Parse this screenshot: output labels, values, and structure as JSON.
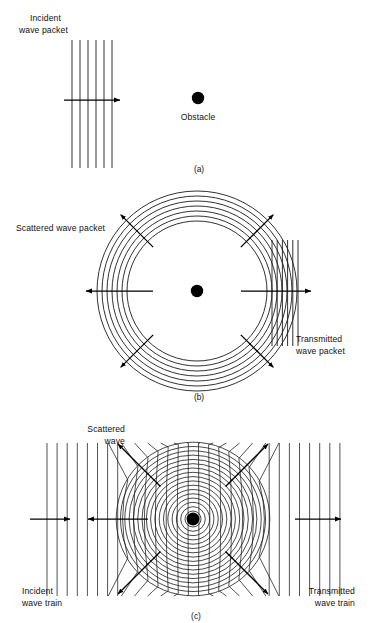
{
  "figure": {
    "title_present": false,
    "background": "#ffffff",
    "ink": "#111111",
    "panels": [
      {
        "id": "a",
        "caption": "(a)",
        "labels": [
          {
            "name": "incident-wave-packet-label",
            "line1": "Incident",
            "line2": "wave packet"
          },
          {
            "name": "obstacle-label",
            "line1": "Obstacle"
          }
        ],
        "elements": {
          "incident_lines_count": 6,
          "obstacle_present": true,
          "arrow_direction": "right"
        }
      },
      {
        "id": "b",
        "caption": "(b)",
        "labels": [
          {
            "name": "scattered-wave-packet-label",
            "line1": "Scattered wave packet"
          },
          {
            "name": "transmitted-wave-packet-label",
            "line1": "Transmitted",
            "line2": "wave packet"
          }
        ],
        "elements": {
          "scattered_rings_count": 7,
          "transmitted_lines_count": 6,
          "radial_arrows_count": 6,
          "obstacle_present": true
        }
      },
      {
        "id": "c",
        "caption": "(c)",
        "labels": [
          {
            "name": "scattered-wave-label",
            "line1": "Scattered",
            "line2": "wave"
          },
          {
            "name": "incident-wave-train-label",
            "line1": "Incident",
            "line2": "wave train"
          },
          {
            "name": "transmitted-wave-train-label",
            "line1": "Transmitted",
            "line2": "wave train"
          }
        ],
        "elements": {
          "scattered_rings_count": 17,
          "plane_wave_lines_count": 30,
          "radial_arrows_count": 6,
          "horizontal_arrows_count": 3,
          "obstacle_present": true
        }
      }
    ]
  },
  "chart_data": {
    "type": "diagram",
    "panels": [
      {
        "id": "a",
        "caption": "(a)",
        "description": "Incident plane wave packet approaching an obstacle",
        "center": {
          "x": 198,
          "y": 98
        },
        "plane_wave": {
          "x_start": 72,
          "x_end": 112,
          "count": 6,
          "spacing": 8,
          "y_top": 40,
          "y_bottom": 168
        },
        "arrow": {
          "x1": 64,
          "y1": 100,
          "x2": 122,
          "y2": 100,
          "dir": "right"
        }
      },
      {
        "id": "b",
        "caption": "(b)",
        "description": "Scattered circular wave packet plus transmitted plane wave packet past the obstacle",
        "center": {
          "x": 197,
          "y": 291
        },
        "rings": {
          "r_min": 70,
          "r_max": 100,
          "count": 7,
          "spacing": 5
        },
        "transmitted_lines": {
          "x_start": 272,
          "x_end": 298,
          "count": 6,
          "spacing": 5.2,
          "y_top": 240,
          "y_bottom": 346
        },
        "radial_arrows_deg": [
          45,
          135,
          180,
          225,
          315,
          360
        ]
      },
      {
        "id": "c",
        "caption": "(c)",
        "description": "Continuous incident wave train, scattered circular waves and transmitted wave train",
        "center": {
          "x": 193,
          "y": 519
        },
        "rings": {
          "r_min": 8,
          "r_max": 76,
          "count": 17,
          "spacing": 4.3
        },
        "plane_wave": {
          "x_start": 47,
          "x_end": 340,
          "count": 30,
          "spacing": 10.1,
          "y_top": 443,
          "y_bottom": 596
        },
        "radial_arrows_deg": [
          45,
          135,
          225,
          315
        ],
        "horizontal_arrows": [
          {
            "x1": 30,
            "y1": 519,
            "x2": 70,
            "y2": 519,
            "dir": "right"
          },
          {
            "x1": 148,
            "y1": 519,
            "x2": 88,
            "y2": 519,
            "dir": "left"
          },
          {
            "x1": 295,
            "y1": 519,
            "x2": 341,
            "y2": 519,
            "dir": "right"
          }
        ]
      }
    ]
  }
}
